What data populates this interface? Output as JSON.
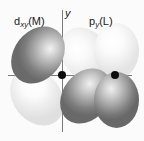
{
  "figure": {
    "background_color": "#fbfbfb",
    "axes": {
      "color": "#7a7a7a",
      "x_label": "x",
      "y_label": "y"
    },
    "orbitals": [
      {
        "id": "d-xy-metal",
        "label_main": "d",
        "label_sub": "xy",
        "label_tail": "(M)",
        "label_full": "dxy(M)",
        "center": "origin",
        "lobes": [
          {
            "name": "upper-left",
            "phase": "dark",
            "color": "#8a8a8a"
          },
          {
            "name": "lower-left",
            "phase": "light",
            "color": "#f2f2f2"
          },
          {
            "name": "upper-right",
            "phase": "light",
            "color": "#f2f2f2"
          },
          {
            "name": "lower-right",
            "phase": "dark",
            "color": "#8a8a8a"
          }
        ]
      },
      {
        "id": "p-y-ligand",
        "label_main": "p",
        "label_sub": "y",
        "label_tail": "(L)",
        "label_full": "py(L)",
        "center": "x-axis-right",
        "lobes": [
          {
            "name": "upper",
            "phase": "light",
            "color": "#f2f2f2"
          },
          {
            "name": "lower",
            "phase": "dark",
            "color": "#8a8a8a"
          }
        ]
      }
    ],
    "atoms": [
      {
        "name": "metal-center",
        "color": "#0d0d0d"
      },
      {
        "name": "ligand-center",
        "color": "#0d0d0d"
      }
    ]
  }
}
